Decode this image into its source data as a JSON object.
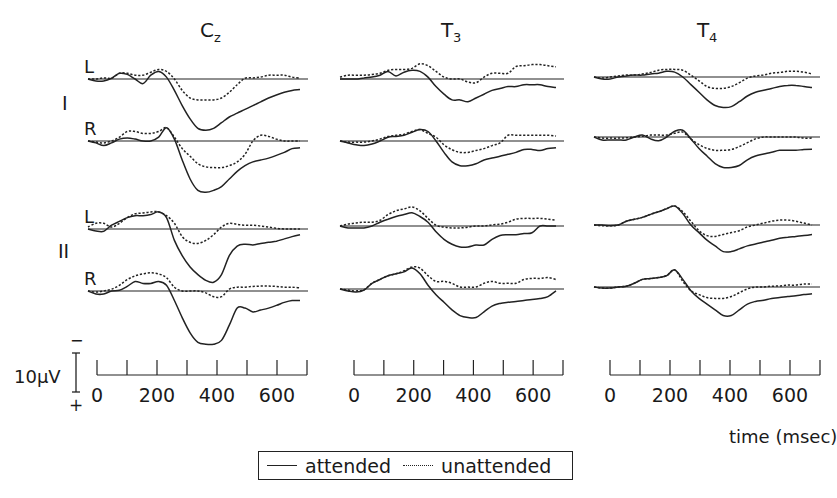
{
  "chart_data": {
    "type": "line",
    "title": "",
    "xlabel": "time (msec)",
    "ylabel": "10µV",
    "polarity": {
      "up": "−",
      "down": "+"
    },
    "scale_bar_uV": 10,
    "xlim": [
      0,
      700
    ],
    "x_ticks": [
      0,
      100,
      200,
      300,
      400,
      500,
      600,
      700
    ],
    "x_tick_labels": [
      "0",
      "200",
      "400",
      "600"
    ],
    "legend": [
      {
        "name": "attended",
        "style": "solid"
      },
      {
        "name": "unattended",
        "style": "dotted"
      }
    ],
    "columns": [
      {
        "label": "C",
        "subscript": "z"
      },
      {
        "label": "T",
        "subscript": "3"
      },
      {
        "label": "T",
        "subscript": "4"
      }
    ],
    "row_groups": [
      {
        "label": "I",
        "rows": [
          "L",
          "R"
        ]
      },
      {
        "label": "II",
        "rows": [
          "L",
          "R"
        ]
      }
    ],
    "x": [
      0,
      25,
      50,
      75,
      100,
      125,
      150,
      175,
      200,
      225,
      250,
      275,
      300,
      325,
      350,
      375,
      400,
      425,
      450,
      475,
      500,
      525,
      550,
      575,
      600,
      625,
      650,
      675
    ],
    "panels": [
      {
        "column": "Cz",
        "group": "I",
        "side": "L",
        "series": [
          {
            "name": "attended",
            "values": [
              0,
              0.5,
              0.5,
              -0.2,
              -1.5,
              -1.2,
              0,
              1.2,
              -1,
              -2,
              -0.5,
              3,
              7,
              10.5,
              13,
              13.5,
              13,
              11.5,
              10,
              9,
              8,
              7,
              6,
              5,
              4.2,
              3.5,
              3,
              2.8
            ]
          },
          {
            "name": "unattended",
            "values": [
              0,
              0,
              -0.3,
              -0.2,
              -1.5,
              -1.5,
              -1,
              -1,
              -1.8,
              -2.5,
              -2,
              0,
              3,
              5,
              5.5,
              5.5,
              5.5,
              5,
              3.5,
              1.5,
              -0.2,
              -0.3,
              -0.5,
              -1,
              -1,
              -1,
              -0.5,
              -0.2
            ]
          }
        ]
      },
      {
        "column": "Cz",
        "group": "I",
        "side": "R",
        "series": [
          {
            "name": "attended",
            "values": [
              0,
              0.5,
              1.2,
              0.5,
              -0.5,
              -0.8,
              -0.5,
              0,
              0,
              -1,
              -3.5,
              -0.5,
              5,
              10,
              13,
              13.5,
              13,
              12,
              10,
              8,
              6.5,
              5.5,
              5,
              4.5,
              3.8,
              3,
              2,
              1.8
            ]
          },
          {
            "name": "unattended",
            "values": [
              0,
              0.3,
              0.5,
              0,
              -1,
              -2.5,
              -2.5,
              -2,
              -2,
              -2.5,
              -3.5,
              -1,
              2,
              4,
              6,
              6.8,
              7,
              7,
              6.5,
              5.5,
              3.5,
              0,
              -1.5,
              -1.2,
              -0.5,
              0,
              0,
              0
            ]
          }
        ]
      },
      {
        "column": "Cz",
        "group": "II",
        "side": "L",
        "series": [
          {
            "name": "attended",
            "values": [
              0,
              0.5,
              0.6,
              -1,
              -2,
              -3,
              -3.5,
              -3.5,
              -3.8,
              -4.5,
              -3,
              3,
              7,
              10,
              12,
              13.5,
              14,
              12,
              7,
              4.5,
              4,
              4.2,
              3.8,
              3.5,
              3.2,
              2.6,
              2,
              1.5
            ]
          },
          {
            "name": "unattended",
            "values": [
              -0.5,
              -1.5,
              -1.5,
              -0.5,
              -1.5,
              -3,
              -4,
              -4.2,
              -4.5,
              -4.5,
              -3.5,
              -1.5,
              2,
              3.5,
              3.8,
              3,
              1.5,
              -0.5,
              -1.5,
              -1.2,
              -1,
              -1,
              -0.8,
              -0.5,
              -0.2,
              0,
              0,
              0
            ]
          }
        ]
      },
      {
        "column": "Cz",
        "group": "II",
        "side": "R",
        "series": [
          {
            "name": "attended",
            "values": [
              0,
              0.8,
              0.8,
              0,
              -0.2,
              -1.2,
              -2.5,
              -2,
              -2,
              -2.5,
              -1.5,
              2.5,
              7,
              11,
              13.5,
              14,
              14,
              13,
              9,
              4.5,
              4.5,
              5.5,
              5,
              4.5,
              3.8,
              3,
              2.5,
              2.5
            ]
          },
          {
            "name": "unattended",
            "values": [
              0,
              0.3,
              0,
              -0.5,
              -1.5,
              -3,
              -4,
              -4.5,
              -4.8,
              -4.5,
              -3.5,
              -1,
              0,
              0,
              0,
              0.5,
              1.5,
              1.5,
              -0.5,
              -1,
              -1,
              -1.2,
              -1.3,
              -1.3,
              -1.2,
              -1,
              -1,
              -0.8
            ]
          }
        ]
      },
      {
        "column": "T3",
        "group": "I",
        "side": "L",
        "series": [
          {
            "name": "attended",
            "values": [
              0,
              0,
              0,
              -0.3,
              -0.5,
              -1,
              -2,
              -0.8,
              -1.8,
              -2.3,
              -2,
              -0.5,
              2,
              4,
              5.5,
              5.5,
              6,
              5,
              4,
              3,
              2.5,
              2,
              2,
              1.5,
              1.5,
              1.5,
              2,
              2.2
            ]
          },
          {
            "name": "unattended",
            "values": [
              -0.5,
              -1,
              -1,
              -1,
              -1.2,
              -1.5,
              -2.3,
              -2.5,
              -2.5,
              -2.8,
              -4,
              -3.5,
              -2,
              -0.5,
              0,
              0,
              0.8,
              1,
              -0.5,
              -1.5,
              -1.5,
              -1.5,
              -3.3,
              -3.5,
              -3.8,
              -3.8,
              -3.5,
              -3.2
            ]
          }
        ]
      },
      {
        "column": "T3",
        "group": "I",
        "side": "R",
        "series": [
          {
            "name": "attended",
            "values": [
              0,
              0.5,
              1,
              1.2,
              0.8,
              0,
              -1,
              -1.2,
              -1.5,
              -2.3,
              -3,
              -2.5,
              0,
              3,
              5.5,
              6.5,
              6.5,
              6,
              5,
              4.5,
              4,
              3.5,
              3,
              2.2,
              2.2,
              2.5,
              2,
              1.8
            ]
          },
          {
            "name": "unattended",
            "values": [
              0,
              0.3,
              0.3,
              0.3,
              0,
              -0.5,
              -1.2,
              -1.5,
              -1.8,
              -2.5,
              -3,
              -2,
              -1,
              1,
              2.3,
              3,
              3,
              2.5,
              2,
              1.2,
              0.5,
              -1.5,
              -1.5,
              -1.5,
              -1.5,
              -1.5,
              -1.5,
              -1.3
            ]
          }
        ]
      },
      {
        "column": "T3",
        "group": "II",
        "side": "L",
        "series": [
          {
            "name": "attended",
            "values": [
              0,
              0.5,
              0.5,
              0.5,
              0,
              -1,
              -1.8,
              -2.5,
              -3,
              -3.5,
              -2.5,
              -1,
              1.5,
              3.5,
              4.8,
              5.5,
              5.5,
              5,
              5,
              3.5,
              2.5,
              2.3,
              2.3,
              2,
              1.8,
              0,
              0,
              0
            ]
          },
          {
            "name": "unattended",
            "values": [
              0,
              -0.5,
              -0.8,
              -1,
              -1,
              -1.5,
              -3,
              -4,
              -4.5,
              -5,
              -4,
              -2,
              -0.2,
              0.3,
              0.5,
              0.5,
              0.3,
              0,
              0,
              -0.3,
              -0.5,
              -1,
              -1.8,
              -2,
              -2,
              -2,
              -1.8,
              -1.5
            ]
          }
        ]
      },
      {
        "column": "T3",
        "group": "II",
        "side": "R",
        "series": [
          {
            "name": "attended",
            "values": [
              0,
              0.5,
              0.8,
              0.3,
              -1.5,
              -2.5,
              -3.5,
              -4,
              -4.5,
              -5.5,
              -4,
              -1,
              1.5,
              3.5,
              5.5,
              7,
              7.5,
              7.5,
              6,
              4.5,
              3.8,
              3.5,
              3.3,
              3,
              2.8,
              2.5,
              2,
              0.5
            ]
          },
          {
            "name": "unattended",
            "values": [
              0,
              0.3,
              0.5,
              0.2,
              -1.5,
              -2.5,
              -3.5,
              -4,
              -4.8,
              -5.8,
              -5.5,
              -3.5,
              -2,
              -2,
              -1.5,
              -0.5,
              -0.5,
              -0.5,
              -1.5,
              -2,
              -1.5,
              -1.5,
              -1.5,
              -2.5,
              -2.8,
              -2.8,
              -3,
              -2.5
            ]
          }
        ]
      },
      {
        "column": "T4",
        "group": "I",
        "side": "L",
        "series": [
          {
            "name": "attended",
            "values": [
              0,
              0.5,
              0.5,
              0,
              -0.3,
              -0.5,
              -0.5,
              -0.8,
              -1,
              -1.5,
              -1.3,
              0,
              2,
              4,
              6,
              7.5,
              8,
              7.8,
              6.5,
              5,
              4,
              3.5,
              3,
              2.5,
              2.2,
              2.2,
              2.5,
              2.8
            ]
          },
          {
            "name": "unattended",
            "values": [
              0,
              0.3,
              0,
              -0.3,
              -0.5,
              -0.5,
              -0.8,
              -1.2,
              -1.8,
              -2,
              -2,
              -1.8,
              -0.5,
              1,
              2.5,
              3,
              3,
              2.5,
              1.5,
              0.3,
              -0.3,
              -0.5,
              -1,
              -1.2,
              -1.5,
              -1.5,
              -1.3,
              -0.8
            ]
          }
        ]
      },
      {
        "column": "T4",
        "group": "I",
        "side": "R",
        "series": [
          {
            "name": "attended",
            "values": [
              0,
              0.8,
              0.8,
              0.8,
              0.8,
              0,
              -0.5,
              0.5,
              1,
              0,
              -1.5,
              -1.8,
              0.5,
              3,
              5,
              7,
              8,
              8,
              7.5,
              6,
              5,
              4.5,
              4,
              3.5,
              3.5,
              3.5,
              3.3,
              3.2
            ]
          },
          {
            "name": "unattended",
            "values": [
              0,
              0.3,
              0.3,
              0.3,
              0.2,
              0,
              -0.2,
              -0.5,
              -0.5,
              -0.5,
              -1,
              -1.3,
              0.5,
              2,
              3,
              3.5,
              3.5,
              3.3,
              2.5,
              1.5,
              0.5,
              0,
              0,
              0,
              0,
              0,
              0.3,
              0.3
            ]
          }
        ]
      },
      {
        "column": "T4",
        "group": "II",
        "side": "L",
        "series": [
          {
            "name": "attended",
            "values": [
              0,
              0,
              0.2,
              0,
              -1,
              -1.5,
              -2,
              -2.8,
              -3.5,
              -4.3,
              -5,
              -3,
              0,
              2,
              4,
              5.5,
              7,
              7,
              6.3,
              5.5,
              5,
              4.5,
              4,
              3.5,
              3.2,
              3,
              2.8,
              2.5
            ]
          },
          {
            "name": "unattended",
            "values": [
              0,
              0.2,
              0.2,
              0,
              -1,
              -1.5,
              -2,
              -2.8,
              -3.5,
              -4.3,
              -5,
              -3.5,
              -1,
              1.5,
              2.8,
              3,
              2.5,
              2,
              1.5,
              0.5,
              0,
              -0.5,
              -1,
              -1.3,
              -1.3,
              -1,
              -0.5,
              0
            ]
          }
        ]
      },
      {
        "column": "T4",
        "group": "II",
        "side": "R",
        "series": [
          {
            "name": "attended",
            "values": [
              0,
              0.3,
              0.3,
              0,
              -0.2,
              -1,
              -2,
              -2.2,
              -2.5,
              -3,
              -4.5,
              -2,
              1,
              3,
              4.5,
              6,
              7.5,
              7.5,
              6,
              4.5,
              3.8,
              3.5,
              3,
              2.8,
              2.5,
              2.3,
              2,
              1.8
            ]
          },
          {
            "name": "unattended",
            "values": [
              0,
              0.3,
              0.3,
              0,
              -0.2,
              -1,
              -2,
              -2.2,
              -2.5,
              -3,
              -4.5,
              -1.5,
              1,
              2,
              2.8,
              3,
              3,
              2.5,
              1.5,
              0.5,
              0,
              0,
              -0.2,
              -0.3,
              -0.5,
              -0.5,
              -0.8,
              -0.8
            ]
          }
        ]
      }
    ]
  },
  "labels": {
    "columns": [
      {
        "main": "C",
        "sub": "z"
      },
      {
        "main": "T",
        "sub": "3"
      },
      {
        "main": "T",
        "sub": "4"
      }
    ],
    "groups": [
      "I",
      "II"
    ],
    "sides": [
      "L",
      "R",
      "L",
      "R"
    ],
    "scale_label": "10µV",
    "scale_minus": "−",
    "scale_plus": "+",
    "tick_labels": [
      "0",
      "200",
      "400",
      "600"
    ],
    "x_axis_label": "time (msec)"
  },
  "legend": {
    "attended": "attended",
    "unattended": "unattended"
  }
}
